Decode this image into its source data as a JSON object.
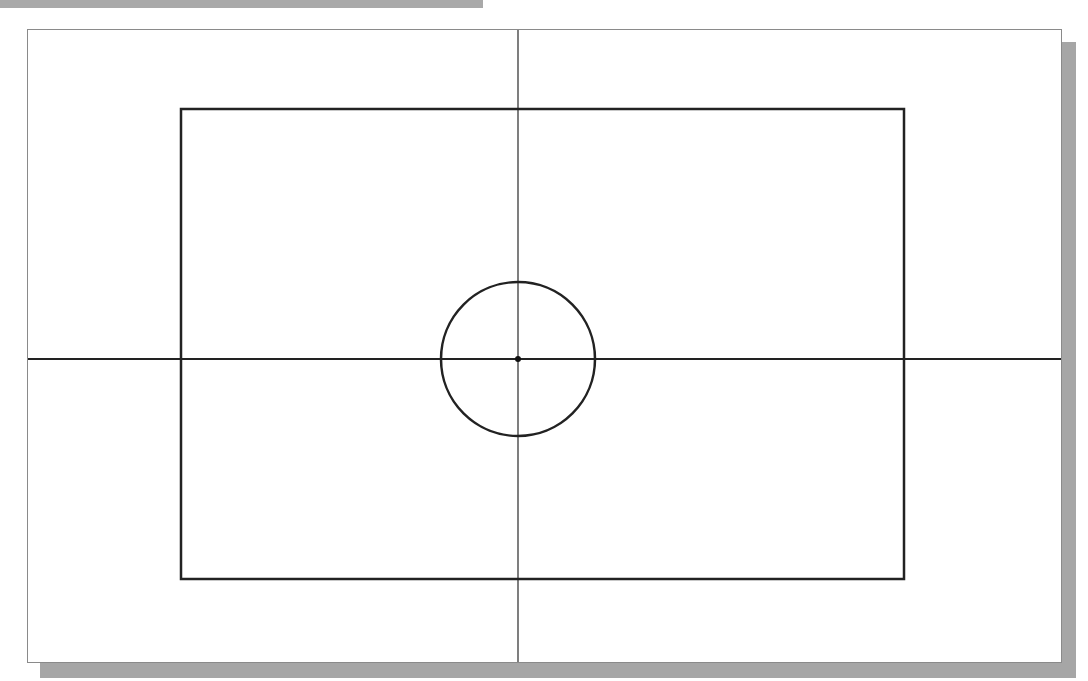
{
  "canvas": {
    "width": 1088,
    "height": 681,
    "background": "#ffffff",
    "top_bar_color": "#a9a9a9",
    "shadow_color": "#a6a6a6",
    "paper_border_color": "#8a8a8a",
    "stroke_color": "#222222"
  },
  "sketch": {
    "rectangle": {
      "x1": 181,
      "y1": 109,
      "x2": 904,
      "y2": 579
    },
    "circle": {
      "cx": 518,
      "cy": 359,
      "r": 77
    },
    "center_point": {
      "x": 518,
      "y": 359
    },
    "horizontal_axis": {
      "y": 359,
      "x1": 28,
      "x2": 1061
    },
    "vertical_axis": {
      "x": 518,
      "y1": 30,
      "y2": 662
    }
  }
}
